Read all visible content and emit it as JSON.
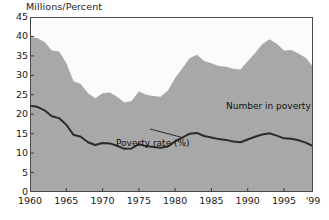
{
  "chart_data": {
    "type": "area",
    "title": "",
    "subtitle": "",
    "ylabel": "Millions/Percent",
    "xlabel": "",
    "ylim": [
      0,
      45
    ],
    "xlim": [
      1960,
      1999
    ],
    "grid": false,
    "legend_position": "inline-annotations",
    "y_ticks": [
      0,
      5,
      10,
      15,
      20,
      25,
      30,
      35,
      40,
      45
    ],
    "y_tick_labels": [
      "0",
      "5",
      "10",
      "15",
      "20",
      "25",
      "30",
      "35",
      "40",
      "45"
    ],
    "x_ticks": [
      1960,
      1965,
      1970,
      1975,
      1980,
      1985,
      1990,
      1995,
      1999
    ],
    "x_tick_labels": [
      "1960",
      "1965",
      "1970",
      "1975",
      "1980",
      "1985",
      "1990",
      "1995",
      "'99"
    ],
    "x": [
      1960,
      1961,
      1962,
      1963,
      1964,
      1965,
      1966,
      1967,
      1968,
      1969,
      1970,
      1971,
      1972,
      1973,
      1974,
      1975,
      1976,
      1977,
      1978,
      1979,
      1980,
      1981,
      1982,
      1983,
      1984,
      1985,
      1986,
      1987,
      1988,
      1989,
      1990,
      1991,
      1992,
      1993,
      1994,
      1995,
      1996,
      1997,
      1998,
      1999
    ],
    "series": [
      {
        "name": "Number in poverty",
        "annotation": "Number in poverty",
        "units": "Millions",
        "render": "area",
        "color": "#a8a8a8",
        "values": [
          39.9,
          39.6,
          38.6,
          36.4,
          36.1,
          33.2,
          28.5,
          27.8,
          25.4,
          24.1,
          25.4,
          25.6,
          24.5,
          23.0,
          23.4,
          25.9,
          25.0,
          24.7,
          24.5,
          26.1,
          29.3,
          31.8,
          34.4,
          35.3,
          33.7,
          33.1,
          32.4,
          32.2,
          31.7,
          31.5,
          33.6,
          35.7,
          38.0,
          39.3,
          38.1,
          36.4,
          36.5,
          35.6,
          34.5,
          32.3
        ]
      },
      {
        "name": "Poverty rate (%)",
        "annotation": "Poverty rate (%)",
        "units": "Percent",
        "render": "line",
        "color": "#2b2b2b",
        "values": [
          22.2,
          21.9,
          21.0,
          19.5,
          19.0,
          17.3,
          14.7,
          14.2,
          12.8,
          12.1,
          12.6,
          12.5,
          11.9,
          11.1,
          11.2,
          12.3,
          11.8,
          11.6,
          11.4,
          11.7,
          13.0,
          14.0,
          15.0,
          15.2,
          14.4,
          14.0,
          13.6,
          13.4,
          13.0,
          12.8,
          13.5,
          14.2,
          14.8,
          15.1,
          14.5,
          13.8,
          13.7,
          13.3,
          12.7,
          11.8
        ]
      }
    ]
  },
  "annotations": {
    "number_in_poverty": "Number in poverty",
    "poverty_rate": "Poverty rate (%)"
  }
}
